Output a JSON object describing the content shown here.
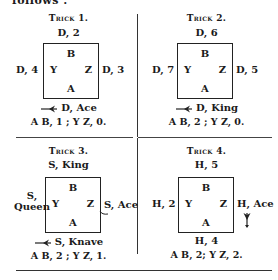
{
  "intro_text": "follows :",
  "tricks": [
    {
      "title": "Trick 1.",
      "north": "D, 2",
      "west": "D, 4",
      "east": "D, 3",
      "seats": {
        "b": "B",
        "y": "Y",
        "z": "Z",
        "a": "A"
      },
      "lead": "D, Ace",
      "lead_position": "south",
      "score": "A B, 1 ; Y Z, 0."
    },
    {
      "title": "Trick 2.",
      "north": "D, 6",
      "west": "D, 7",
      "east": "D, 5",
      "seats": {
        "b": "B",
        "y": "Y",
        "z": "Z",
        "a": "A"
      },
      "lead": "D, King",
      "lead_position": "south",
      "score": "A B, 2 ; Y Z, 0."
    },
    {
      "title": "Trick 3.",
      "north": "S, King",
      "west_line1": "S,",
      "west_line2": "Queen",
      "east": "S, Ace",
      "seats": {
        "b": "B",
        "y": "Y",
        "z": "Z",
        "a": "A"
      },
      "lead": "S, Knave",
      "lead_position": "south",
      "score": "A B, 2 ; Y Z, 1."
    },
    {
      "title": "Trick 4.",
      "north": "H, 5",
      "west": "H, 2",
      "east": "H, Ace",
      "south": "H, 4",
      "seats": {
        "b": "B",
        "y": "Y",
        "z": "Z",
        "a": "A"
      },
      "lead_position": "east",
      "score": "A B, 2; Y Z, 2."
    }
  ]
}
